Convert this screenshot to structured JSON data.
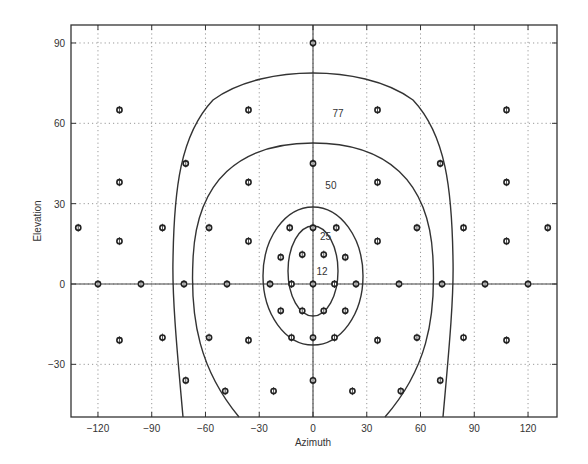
{
  "chart_data": {
    "type": "scatter",
    "title": "",
    "xlabel": "Azimuth",
    "ylabel": "Elevation",
    "xlim": [
      -135,
      135
    ],
    "ylim": [
      -50,
      97
    ],
    "grid": true,
    "grid_style": "dotted",
    "legend": null,
    "xticks": [
      -120,
      -90,
      -60,
      -30,
      0,
      30,
      60,
      90,
      120
    ],
    "xtick_labels": [
      "-120",
      "-90",
      "-60",
      "-30",
      "0",
      "30",
      "60",
      "90",
      "120"
    ],
    "yticks": [
      -30,
      0,
      30,
      60,
      90
    ],
    "ytick_labels": [
      "-30",
      "0",
      "30",
      "60",
      "90"
    ],
    "reference_lines": [
      {
        "orientation": "horizontal",
        "value": 0
      },
      {
        "orientation": "vertical",
        "value": 0
      }
    ],
    "series": [
      {
        "name": "measurement-positions",
        "marker": "open-diamond-circle",
        "points": [
          [
            0,
            90
          ],
          [
            -108,
            65
          ],
          [
            -36,
            65
          ],
          [
            36,
            65
          ],
          [
            108,
            65
          ],
          [
            -71,
            45
          ],
          [
            0,
            45
          ],
          [
            71,
            45
          ],
          [
            -108,
            38
          ],
          [
            -36,
            38
          ],
          [
            36,
            38
          ],
          [
            108,
            38
          ],
          [
            -131,
            21
          ],
          [
            -84,
            21
          ],
          [
            -58,
            21
          ],
          [
            -13,
            21
          ],
          [
            0,
            21
          ],
          [
            13,
            21
          ],
          [
            58,
            21
          ],
          [
            84,
            21
          ],
          [
            131,
            21
          ],
          [
            -108,
            16
          ],
          [
            -36,
            16
          ],
          [
            36,
            16
          ],
          [
            108,
            16
          ],
          [
            -18,
            10
          ],
          [
            -6,
            11
          ],
          [
            6,
            11
          ],
          [
            18,
            10
          ],
          [
            -120,
            0
          ],
          [
            -96,
            0
          ],
          [
            -72,
            0
          ],
          [
            -48,
            0
          ],
          [
            -24,
            0
          ],
          [
            -12,
            0
          ],
          [
            0,
            0
          ],
          [
            12,
            0
          ],
          [
            24,
            0
          ],
          [
            48,
            0
          ],
          [
            72,
            0
          ],
          [
            96,
            0
          ],
          [
            120,
            0
          ],
          [
            -18,
            -10
          ],
          [
            -6,
            -10
          ],
          [
            6,
            -10
          ],
          [
            18,
            -10
          ],
          [
            -108,
            -21
          ],
          [
            -84,
            -20
          ],
          [
            -58,
            -20
          ],
          [
            -36,
            -21
          ],
          [
            -12,
            -20
          ],
          [
            0,
            -20
          ],
          [
            12,
            -20
          ],
          [
            36,
            -21
          ],
          [
            58,
            -20
          ],
          [
            84,
            -20
          ],
          [
            108,
            -21
          ],
          [
            -71,
            -36
          ],
          [
            0,
            -36
          ],
          [
            71,
            -36
          ],
          [
            -49,
            -40
          ],
          [
            -22,
            -40
          ],
          [
            22,
            -40
          ],
          [
            49,
            -40
          ]
        ]
      }
    ],
    "contours": [
      {
        "level": "12",
        "label_position": [
          5,
          5
        ]
      },
      {
        "level": "25",
        "label_position": [
          7,
          18
        ]
      },
      {
        "level": "50",
        "label_position": [
          10,
          37
        ]
      },
      {
        "level": "77",
        "label_position": [
          14,
          64
        ]
      }
    ]
  }
}
